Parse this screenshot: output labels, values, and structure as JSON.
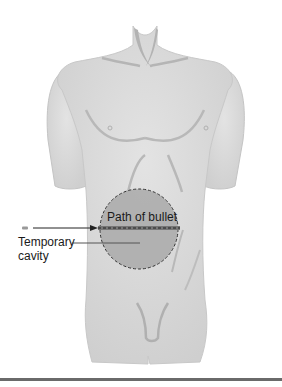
{
  "figure": {
    "type": "anatomical-diagram",
    "labels": {
      "path_of_bullet": "Path of bullet",
      "temporary_cavity_line1": "Temporary",
      "temporary_cavity_line2": "cavity"
    },
    "colors": {
      "background": "#ffffff",
      "skin": "#d9d9d9",
      "skin_shadow": "#b8b8b8",
      "cavity_fill": "#a9a9a9",
      "cavity_outline": "#333333",
      "bullet_path": "#555555",
      "arrow": "#222222",
      "rule": "#6a6a6a"
    }
  }
}
